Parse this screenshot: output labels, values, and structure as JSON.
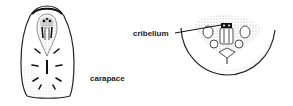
{
  "figure": {
    "type": "anatomical illustration",
    "panels": [
      {
        "name": "carapace-view",
        "label": "carapace"
      },
      {
        "name": "cribellum-view",
        "label": "cribellum"
      }
    ]
  },
  "labels": {
    "carapace": "carapace",
    "cribellum": "cribellum"
  },
  "colors": {
    "ink": "#222222",
    "background": "#ffffff"
  }
}
